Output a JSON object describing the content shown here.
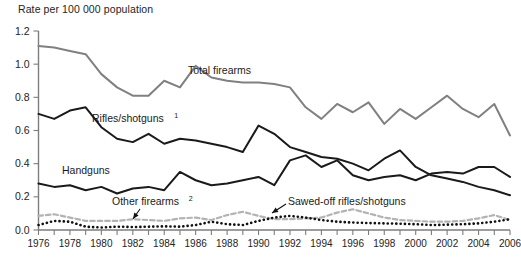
{
  "chart_data": {
    "type": "line",
    "title": "Rate per 100 000 population",
    "xlabel": "",
    "ylabel": "Rate per 100 000 population",
    "ylim": [
      0.0,
      1.2
    ],
    "xlim": [
      1976,
      2006
    ],
    "ytick_labels": [
      "0.0",
      "0.2",
      "0.4",
      "0.6",
      "0.8",
      "1.0",
      "1.2"
    ],
    "ytick_values": [
      0.0,
      0.2,
      0.4,
      0.6,
      0.8,
      1.0,
      1.2
    ],
    "x": [
      1976,
      1977,
      1978,
      1979,
      1980,
      1981,
      1982,
      1983,
      1984,
      1985,
      1986,
      1987,
      1988,
      1989,
      1990,
      1991,
      1992,
      1993,
      1994,
      1995,
      1996,
      1997,
      1998,
      1999,
      2000,
      2001,
      2002,
      2003,
      2004,
      2005,
      2006
    ],
    "xtick_labels": [
      "1976",
      "1978",
      "1980",
      "1982",
      "1984",
      "1986",
      "1988",
      "1990",
      "1992",
      "1994",
      "1996",
      "1998",
      "2000",
      "2002",
      "2004",
      "2006"
    ],
    "xtick_values": [
      1976,
      1978,
      1980,
      1982,
      1984,
      1986,
      1988,
      1990,
      1992,
      1994,
      1996,
      1998,
      2000,
      2002,
      2004,
      2006
    ],
    "minor_xticks_every": 1,
    "grid": false,
    "legend_position": "inline-annotations",
    "series": [
      {
        "name": "Total firearms",
        "label": "Total firearms",
        "label_superscript": "",
        "style": "solid",
        "color": "#808080",
        "width": 2.0,
        "values": [
          1.11,
          1.1,
          1.08,
          1.06,
          0.94,
          0.86,
          0.81,
          0.81,
          0.9,
          0.86,
          0.99,
          0.92,
          0.9,
          0.89,
          0.89,
          0.88,
          0.86,
          0.74,
          0.67,
          0.76,
          0.71,
          0.77,
          0.64,
          0.73,
          0.67,
          0.74,
          0.81,
          0.73,
          0.68,
          0.76,
          0.57
        ]
      },
      {
        "name": "Rifles/shotguns",
        "label": "Rifles/shotguns",
        "label_superscript": "1",
        "style": "solid",
        "color": "#1a1a1a",
        "width": 2.0,
        "values": [
          0.7,
          0.67,
          0.72,
          0.74,
          0.62,
          0.55,
          0.53,
          0.58,
          0.52,
          0.55,
          0.54,
          0.52,
          0.5,
          0.47,
          0.63,
          0.58,
          0.5,
          0.47,
          0.44,
          0.43,
          0.4,
          0.36,
          0.43,
          0.48,
          0.38,
          0.33,
          0.31,
          0.29,
          0.26,
          0.24,
          0.21
        ]
      },
      {
        "name": "Handguns",
        "label": "Handguns",
        "label_superscript": "",
        "style": "solid",
        "color": "#1a1a1a",
        "width": 2.0,
        "values": [
          0.28,
          0.26,
          0.27,
          0.24,
          0.26,
          0.22,
          0.25,
          0.26,
          0.24,
          0.35,
          0.3,
          0.27,
          0.28,
          0.3,
          0.32,
          0.27,
          0.42,
          0.45,
          0.38,
          0.42,
          0.33,
          0.3,
          0.32,
          0.33,
          0.3,
          0.34,
          0.35,
          0.34,
          0.38,
          0.38,
          0.32
        ]
      },
      {
        "name": "Other firearms",
        "label": "Other firearms",
        "label_superscript": "2",
        "style": "dashed",
        "color": "#b3b3b3",
        "width": 2.2,
        "values": [
          0.085,
          0.095,
          0.075,
          0.055,
          0.055,
          0.055,
          0.065,
          0.06,
          0.055,
          0.07,
          0.075,
          0.06,
          0.09,
          0.11,
          0.085,
          0.065,
          0.065,
          0.07,
          0.075,
          0.105,
          0.125,
          0.1,
          0.075,
          0.06,
          0.055,
          0.05,
          0.05,
          0.055,
          0.07,
          0.09,
          0.06
        ]
      },
      {
        "name": "Sawed-off rifles/shotguns",
        "label": "Sawed-off rifles/shotguns",
        "label_superscript": "",
        "style": "dotted",
        "color": "#111111",
        "width": 2.6,
        "values": [
          0.03,
          0.055,
          0.05,
          0.02,
          0.015,
          0.02,
          0.018,
          0.02,
          0.022,
          0.02,
          0.03,
          0.05,
          0.035,
          0.03,
          0.055,
          0.075,
          0.085,
          0.075,
          0.06,
          0.05,
          0.045,
          0.042,
          0.04,
          0.038,
          0.035,
          0.03,
          0.032,
          0.035,
          0.04,
          0.05,
          0.065
        ]
      }
    ],
    "annotations": [
      {
        "text": "Total firearms",
        "sup": "",
        "x_px": 188,
        "y_px": 74,
        "leader": false
      },
      {
        "text": "Rifles/shotguns",
        "sup": "1",
        "x_px": 92,
        "y_px": 122,
        "leader": false
      },
      {
        "text": "Handguns",
        "sup": "",
        "x_px": 62,
        "y_px": 174,
        "leader": false
      },
      {
        "text": "Other firearms",
        "sup": "2",
        "x_px": 112,
        "y_px": 205,
        "leader": true,
        "leader_from_x": 140,
        "leader_from_y": 209,
        "leader_to_x": 133,
        "leader_to_y": 219
      },
      {
        "text": "Sawed-off rifles/shotguns",
        "sup": "",
        "x_px": 288,
        "y_px": 205,
        "leader": true,
        "leader_from_x": 286,
        "leader_from_y": 204,
        "leader_to_x": 272,
        "leader_to_y": 213
      }
    ]
  }
}
